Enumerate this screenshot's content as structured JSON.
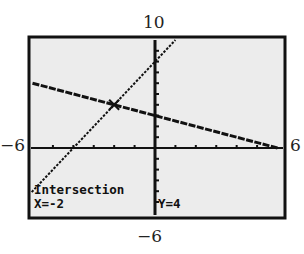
{
  "window": {
    "xmin_label": "−6",
    "xmax_label": "6",
    "ymax_label": "10",
    "ymin_label": "−6",
    "xmin": -6,
    "xmax": 6,
    "ymin": -6,
    "ymax": 10
  },
  "screen": {
    "title": "Intersection",
    "x_readout": "X=-2",
    "y_readout": "Y=4",
    "background": "#ebebeb",
    "border": "#111111"
  },
  "chart_data": {
    "type": "line",
    "title": "Intersection",
    "xlabel": "",
    "ylabel": "",
    "xlim": [
      -6,
      6
    ],
    "ylim": [
      -6,
      10
    ],
    "grid": false,
    "tick_spacing_x": 1,
    "tick_spacing_y": 1,
    "series": [
      {
        "name": "y = -0.5x + 3",
        "x": [
          -6,
          6
        ],
        "y": [
          6,
          0
        ]
      },
      {
        "name": "y = 2x + 8",
        "x": [
          -7,
          1
        ],
        "y": [
          -6,
          10
        ]
      }
    ],
    "annotations": [
      {
        "text": "Intersection",
        "x": -2,
        "y": 4
      },
      {
        "text": "X=-2",
        "value": -2
      },
      {
        "text": "Y=4",
        "value": 4
      }
    ],
    "tick_labels": {
      "left": "−6",
      "right": "6",
      "top": "10",
      "bottom": "−6"
    }
  }
}
